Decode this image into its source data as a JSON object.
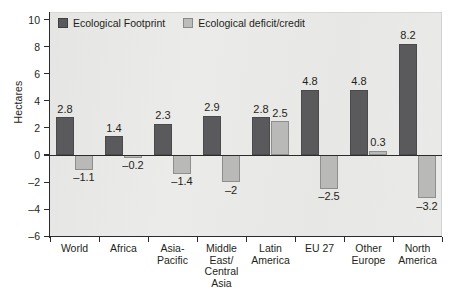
{
  "chart_data": {
    "type": "bar",
    "title": "",
    "xlabel": "",
    "ylabel": "Hectares",
    "ylim": [
      -6,
      10
    ],
    "ytick_labels": [
      "10",
      "8",
      "6",
      "4",
      "2",
      "0",
      "-2",
      "-4",
      "-6"
    ],
    "ytick_values": [
      10,
      8,
      6,
      4,
      2,
      0,
      -2,
      -4,
      -6
    ],
    "grid": false,
    "legend_position": "top-left",
    "categories": [
      "World",
      "Africa",
      "Asia-\nPacific",
      "Middle\nEast/\nCentral\nAsia",
      "Latin\nAmerica",
      "EU 27",
      "Other\nEurope",
      "North\nAmerica"
    ],
    "series": [
      {
        "name": "Ecological Footprint",
        "color": "#5a5a5c",
        "values": [
          2.8,
          1.4,
          2.3,
          2.9,
          2.8,
          4.8,
          4.8,
          8.2
        ],
        "labels": [
          "2.8",
          "1.4",
          "2.3",
          "2.9",
          "2.8",
          "4.8",
          "4.8",
          "8.2"
        ]
      },
      {
        "name": "Ecological deficit/credit",
        "color": "#b9b9b7",
        "values": [
          -1.1,
          -0.2,
          -1.4,
          -2,
          2.5,
          -2.5,
          0.3,
          -3.2
        ],
        "labels": [
          "-1.1",
          "-0.2",
          "-1.4",
          "-2",
          "2.5",
          "-2.5",
          "0.3",
          "-3.2"
        ]
      }
    ]
  },
  "legend": {
    "items": [
      {
        "label": "Ecological Footprint",
        "swatch": "dark"
      },
      {
        "label": "Ecological deficit/credit",
        "swatch": "light"
      }
    ]
  },
  "axes": {
    "y_title": "Hectares"
  },
  "colors": {
    "series_dark": "#5a5a5c",
    "series_light": "#b9b9b7",
    "plot_background": "#e9e9e7",
    "axis": "#2b2b2b",
    "text": "#231f20"
  }
}
